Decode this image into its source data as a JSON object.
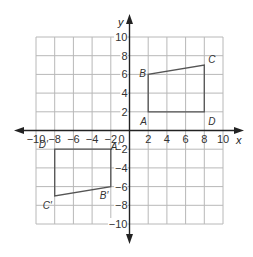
{
  "figure": {
    "type": "coordinate-grid-transformation",
    "axes": {
      "x_label": "x",
      "y_label": "y",
      "range": [
        -10,
        10
      ],
      "grid_step": 2,
      "x_ticks": [
        "-10",
        "-8",
        "-6",
        "-4",
        "-2",
        "0",
        "2",
        "4",
        "6",
        "8",
        "10"
      ],
      "y_ticks": [
        "10",
        "8",
        "6",
        "4",
        "2",
        "-2",
        "-4",
        "-6",
        "-8",
        "-10"
      ]
    },
    "shapes": [
      {
        "name": "ABCD",
        "vertices": [
          {
            "label": "A",
            "x": 2,
            "y": 2
          },
          {
            "label": "B",
            "x": 2,
            "y": 6
          },
          {
            "label": "C",
            "x": 8,
            "y": 7
          },
          {
            "label": "D",
            "x": 8,
            "y": 2
          }
        ]
      },
      {
        "name": "A'B'C'D'",
        "vertices": [
          {
            "label": "A'",
            "x": -2,
            "y": -2
          },
          {
            "label": "B'",
            "x": -2,
            "y": -6
          },
          {
            "label": "C'",
            "x": -8,
            "y": -7
          },
          {
            "label": "D'",
            "x": -8,
            "y": -2
          }
        ]
      }
    ],
    "colors": {
      "grid": "#b8b8b8",
      "axis": "#222222",
      "shape": "#555555"
    }
  }
}
